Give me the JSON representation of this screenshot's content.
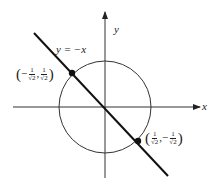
{
  "diagram": {
    "axes": {
      "x_label": "x",
      "y_label": "y"
    },
    "line_label": "y = −x",
    "point_upper_left": {
      "label_x_sign": "−",
      "label_x_num": "1",
      "label_x_den": "√2",
      "label_y_sign": "",
      "label_y_num": "1",
      "label_y_den": "√2",
      "comma": ","
    },
    "point_lower_right": {
      "label_x_sign": "",
      "label_x_num": "1",
      "label_x_den": "√2",
      "label_y_sign": "−",
      "label_y_num": "1",
      "label_y_den": "√2",
      "comma": ","
    },
    "parens": {
      "open": "(",
      "close": ")"
    },
    "colors": {
      "stroke": "#222222",
      "background": "#ffffff"
    }
  }
}
